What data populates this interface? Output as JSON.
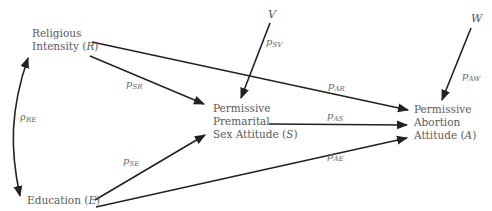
{
  "diagram": {
    "type": "path-analysis",
    "nodes": {
      "religious": {
        "line1": "Religious",
        "line2": "Intensity (",
        "sym": "R",
        "close": ")"
      },
      "education": {
        "text": "Education (",
        "sym": "E",
        "close": ")"
      },
      "sex_attitude": {
        "line1": "Permissive",
        "line2": "Premarital",
        "line3": "Sex Attitude (",
        "sym": "S",
        "close": ")"
      },
      "abortion": {
        "line1": "Permissive",
        "line2": "Abortion",
        "line3": "Attitude (",
        "sym": "A",
        "close": ")"
      },
      "v": {
        "text": "V"
      },
      "w": {
        "text": "W"
      }
    },
    "paths": {
      "rho_re": {
        "base": "ρ",
        "sub": "RE"
      },
      "p_sr": {
        "base": "p",
        "sub": "SR"
      },
      "p_se": {
        "base": "p",
        "sub": "SE"
      },
      "p_sv": {
        "base": "p",
        "sub": "SV"
      },
      "p_ar": {
        "base": "p",
        "sub": "AR"
      },
      "p_as": {
        "base": "p",
        "sub": "AS"
      },
      "p_ae": {
        "base": "p",
        "sub": "AE"
      },
      "p_aw": {
        "base": "p",
        "sub": "AW"
      }
    },
    "edges": [
      {
        "from": "R",
        "to": "S",
        "label": "p_SR"
      },
      {
        "from": "R",
        "to": "A",
        "label": "p_AR"
      },
      {
        "from": "E",
        "to": "S",
        "label": "p_SE"
      },
      {
        "from": "E",
        "to": "A",
        "label": "p_AE"
      },
      {
        "from": "S",
        "to": "A",
        "label": "p_AS"
      },
      {
        "from": "V",
        "to": "S",
        "label": "p_SV"
      },
      {
        "from": "W",
        "to": "A",
        "label": "p_AW"
      },
      {
        "from": "R",
        "to": "E",
        "label": "rho_RE",
        "bidirectional": true
      }
    ]
  }
}
